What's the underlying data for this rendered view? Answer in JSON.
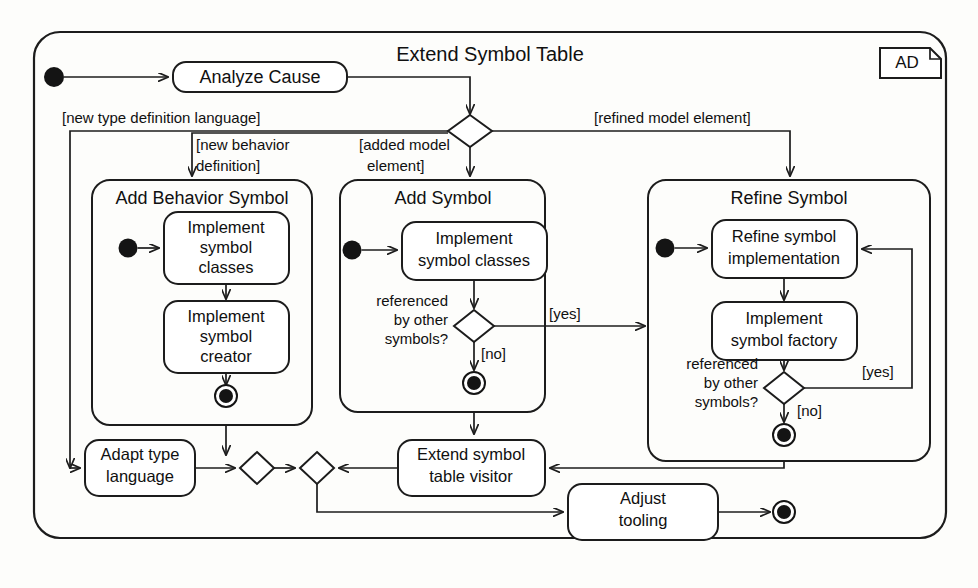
{
  "diagram": {
    "kind": "uml-activity-diagram",
    "title": "Extend Symbol Table",
    "frame_tag": "AD",
    "colors": {
      "stroke": "#1c1c1c",
      "fill": "#ffffff",
      "background": "#fdfdfb",
      "node_fill": "#141414"
    },
    "top_flow": {
      "start_node": "initial-node",
      "first_action": "Analyze Cause"
    },
    "branch_guards": {
      "left": "[new type definition language]",
      "middle_left": "[new behavior definition]",
      "middle": "[added model element]",
      "right": "[refined model element]"
    },
    "lanes": [
      {
        "id": "add-behavior-symbol",
        "title": "Add Behavior Symbol",
        "actions": [
          "Implement symbol classes",
          "Implement symbol creator"
        ],
        "action_lines": [
          [
            "Implement",
            "symbol",
            "classes"
          ],
          [
            "Implement",
            "symbol",
            "creator"
          ]
        ],
        "has_initial_node": true,
        "has_final_node": true
      },
      {
        "id": "add-symbol",
        "title": "Add Symbol",
        "actions": [
          "Implement symbol classes"
        ],
        "action_lines": [
          [
            "Implement",
            "symbol classes"
          ]
        ],
        "decision": {
          "question_lines": [
            "referenced",
            "by other",
            "symbols?"
          ],
          "guard_yes": "[yes]",
          "guard_no": "[no]"
        },
        "has_initial_node": true,
        "has_final_node": true
      },
      {
        "id": "refine-symbol",
        "title": "Refine Symbol",
        "actions": [
          "Refine symbol implementation",
          "Implement symbol factory"
        ],
        "action_lines": [
          [
            "Refine symbol",
            "implementation"
          ],
          [
            "Implement",
            "symbol factory"
          ]
        ],
        "decision": {
          "question_lines": [
            "referenced",
            "by other",
            "symbols?"
          ],
          "guard_yes": "[yes]",
          "guard_no": "[no]"
        },
        "has_initial_node": true,
        "has_final_node": true
      }
    ],
    "bottom_actions": [
      {
        "id": "adapt-type-language",
        "lines": [
          "Adapt type",
          "language"
        ]
      },
      {
        "id": "extend-symbol-table-visitor",
        "lines": [
          "Extend symbol",
          "table visitor"
        ]
      },
      {
        "id": "adjust-tooling",
        "lines": [
          "Adjust",
          "tooling"
        ]
      }
    ],
    "merge_nodes": [
      "merge-left",
      "merge-right"
    ],
    "end_node": "activity-final-node"
  }
}
